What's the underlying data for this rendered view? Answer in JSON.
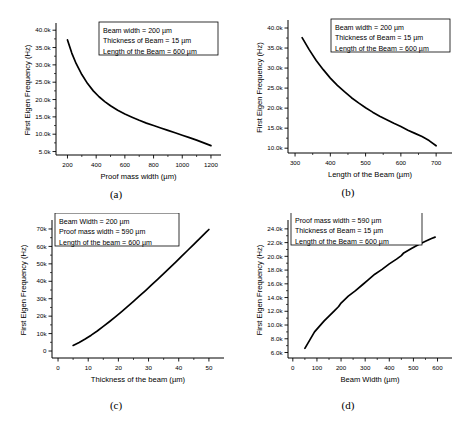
{
  "figure": {
    "panels": [
      {
        "id": "a",
        "sublabel": "(a)",
        "legend": [
          "Beam width = 200 µm",
          "Thickness of Beam = 15 µm",
          "Length of the Beam = 600 µm"
        ],
        "chart_data": {
          "type": "line",
          "title": "",
          "xlabel": "Proof mass width (µm)",
          "ylabel": "First Eigen Frequency (Hz)",
          "xlim": [
            120,
            1270
          ],
          "ylim": [
            4000,
            41500
          ],
          "xticks": [
            200,
            400,
            600,
            800,
            1000,
            1200
          ],
          "xticklabels": [
            "200",
            "400",
            "600",
            "800",
            "1000",
            "1200"
          ],
          "yticks": [
            5000,
            10000,
            15000,
            20000,
            25000,
            30000,
            35000,
            40000
          ],
          "yticklabels": [
            "5.0k",
            "10.0k",
            "15.0k",
            "20.0k",
            "25.0k",
            "30.0k",
            "35.0k",
            "40.0k"
          ],
          "grid": false,
          "legend_position": "top-right",
          "x": [
            200,
            230,
            260,
            300,
            340,
            380,
            420,
            460,
            500,
            550,
            600,
            650,
            700,
            750,
            800,
            850,
            900,
            950,
            1000,
            1050,
            1100,
            1150,
            1200
          ],
          "y": [
            37200,
            33400,
            30400,
            27200,
            24600,
            22500,
            20800,
            19400,
            18200,
            16900,
            15800,
            14900,
            14000,
            13200,
            12500,
            11800,
            11100,
            10400,
            9700,
            9000,
            8300,
            7500,
            6700
          ]
        }
      },
      {
        "id": "b",
        "sublabel": "(b)",
        "legend": [
          "Beam width = 200 µm",
          "Thickness of Beam = 15 µm",
          "Length of the Beam = 600 µm"
        ],
        "chart_data": {
          "type": "line",
          "title": "",
          "xlabel": "Length of the Beam (µm)",
          "ylabel": "First Eigen Frequency (Hz)",
          "xlim": [
            280,
            745
          ],
          "ylim": [
            8800,
            41500
          ],
          "xticks": [
            300,
            400,
            500,
            600,
            700
          ],
          "xticklabels": [
            "300",
            "400",
            "500",
            "600",
            "700"
          ],
          "yticks": [
            10000,
            15000,
            20000,
            25000,
            30000,
            35000,
            40000
          ],
          "yticklabels": [
            "10.0k",
            "15.0k",
            "20.0k",
            "25.0k",
            "30.0k",
            "35.0k",
            "40.0k"
          ],
          "grid": false,
          "legend_position": "top-right",
          "x": [
            320,
            340,
            360,
            380,
            400,
            420,
            440,
            460,
            480,
            500,
            520,
            540,
            560,
            580,
            600,
            620,
            640,
            660,
            680,
            700
          ],
          "y": [
            37600,
            34600,
            31900,
            29600,
            27500,
            25700,
            24100,
            22600,
            21300,
            20100,
            19000,
            18000,
            17100,
            16200,
            15400,
            14500,
            13700,
            12900,
            11900,
            10600
          ]
        }
      },
      {
        "id": "c",
        "sublabel": "(c)",
        "legend": [
          "Beam Width = 200 µm",
          "Proof mass width = 590 µm",
          "Length of the beam = 600 µm"
        ],
        "chart_data": {
          "type": "line",
          "title": "",
          "xlabel": "Thickness of the beam (µm)",
          "ylabel": "First Eigen Frequency (Hz)",
          "xlim": [
            -2,
            55
          ],
          "ylim": [
            -4000,
            74000
          ],
          "xticks": [
            0,
            10,
            20,
            30,
            40,
            50
          ],
          "xticklabels": [
            "0",
            "10",
            "20",
            "30",
            "40",
            "50"
          ],
          "yticks": [
            0,
            10000,
            20000,
            30000,
            40000,
            50000,
            60000,
            70000
          ],
          "yticklabels": [
            "0",
            "10k",
            "20k",
            "30k",
            "40k",
            "50k",
            "60k",
            "70k"
          ],
          "grid": false,
          "legend_position": "top-left",
          "x": [
            5,
            7,
            9,
            11,
            13,
            15,
            17,
            19,
            21,
            23,
            25,
            27,
            29,
            31,
            33,
            35,
            37,
            39,
            41,
            43,
            45,
            47,
            49,
            50
          ],
          "y": [
            3200,
            4900,
            6900,
            9100,
            11500,
            14100,
            16800,
            19600,
            22500,
            25500,
            28500,
            31600,
            34700,
            37900,
            41100,
            44400,
            47700,
            51000,
            54400,
            57800,
            61200,
            64600,
            68000,
            69700
          ]
        }
      },
      {
        "id": "d",
        "sublabel": "(d)",
        "legend": [
          "Proof mass width = 590 µm",
          "Thickness of Beam = 15 µm",
          "Length of the Beam = 600 µm"
        ],
        "chart_data": {
          "type": "line",
          "title": "",
          "xlabel": "Beam Width (µm)",
          "ylabel": "First Eigen Frequency (Hz)",
          "xlim": [
            -20,
            660
          ],
          "ylim": [
            5200,
            25000
          ],
          "xticks": [
            0,
            100,
            200,
            300,
            400,
            500,
            600
          ],
          "xticklabels": [
            "0",
            "100",
            "200",
            "300",
            "400",
            "500",
            "600"
          ],
          "yticks": [
            6000,
            8000,
            10000,
            12000,
            14000,
            16000,
            18000,
            20000,
            22000,
            24000
          ],
          "yticklabels": [
            "6.0k",
            "8.0k",
            "10.0k",
            "12.0k",
            "14.0k",
            "16.0k",
            "18.0k",
            "20.0k",
            "22.0k",
            "24.0k"
          ],
          "grid": false,
          "legend_position": "top-left",
          "x": [
            50,
            70,
            90,
            110,
            130,
            150,
            170,
            190,
            200,
            230,
            260,
            290,
            310,
            340,
            370,
            400,
            430,
            450,
            460,
            490,
            520,
            550,
            575,
            590
          ],
          "y": [
            6600,
            7800,
            9000,
            9800,
            10600,
            11300,
            12000,
            12700,
            13200,
            14200,
            15000,
            15900,
            16500,
            17400,
            18100,
            18900,
            19600,
            20100,
            20500,
            21100,
            21700,
            22200,
            22600,
            22800
          ]
        }
      }
    ]
  }
}
